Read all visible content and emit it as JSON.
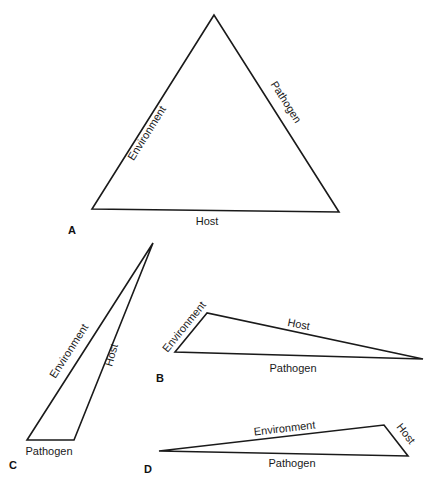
{
  "figure": {
    "panels": [
      {
        "id": "A",
        "label": "A",
        "vertices": [
          [
            214,
            15
          ],
          [
            92,
            209
          ],
          [
            339,
            212
          ]
        ],
        "sides": {
          "left": "Environment",
          "right": "Pathogen",
          "bottom": "Host"
        }
      },
      {
        "id": "B",
        "label": "B",
        "vertices": [
          [
            207,
            313
          ],
          [
            175,
            352
          ],
          [
            423,
            359
          ]
        ],
        "sides": {
          "short": "Environment",
          "top": "Host",
          "bottom": "Pathogen"
        }
      },
      {
        "id": "C",
        "label": "C",
        "vertices": [
          [
            153,
            243
          ],
          [
            27,
            440
          ],
          [
            74,
            440
          ]
        ],
        "sides": {
          "left": "Environment",
          "right": "Host",
          "bottom": "Pathogen"
        }
      },
      {
        "id": "D",
        "label": "D",
        "vertices": [
          [
            159,
            451
          ],
          [
            384,
            425
          ],
          [
            408,
            456
          ]
        ],
        "sides": {
          "top": "Environment",
          "short": "Host",
          "bottom": "Pathogen"
        }
      }
    ]
  },
  "colors": {
    "line": "#1a1a1a",
    "text": "#1a1a1a",
    "background": "#ffffff"
  }
}
